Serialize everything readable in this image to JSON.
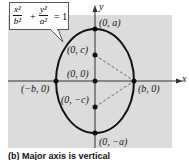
{
  "equation": {
    "term1_num": "x²",
    "term1_den": "b²",
    "plus": "+",
    "term2_num": "y²",
    "term2_den": "a²",
    "equals": "= 1"
  },
  "axes": {
    "x_label": "x",
    "y_label": "y"
  },
  "points": {
    "top": "(0, a)",
    "focus_top": "(0, c)",
    "center": "(0, 0)",
    "left": "(−b, 0)",
    "right": "(b, 0)",
    "focus_bottom": "(0, −c)",
    "bottom": "(0, −a)"
  },
  "caption": "(b) Major axis is vertical",
  "colors": {
    "panel": "#dcdcdc",
    "curve": "#111111",
    "dashed": "#8a8a8a"
  }
}
